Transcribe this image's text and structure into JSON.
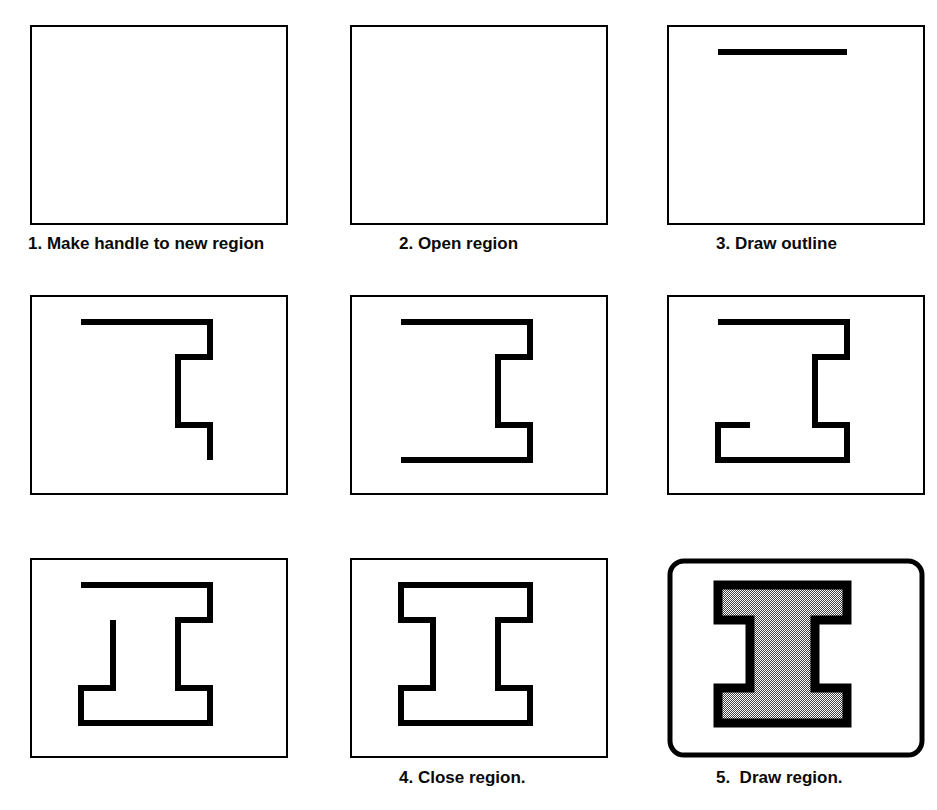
{
  "figure": {
    "background_color": "#ffffff",
    "ink_color": "#000000",
    "fill_pattern_color": "#808080",
    "panel_count": 9,
    "caption_count": 5
  },
  "panels": [
    {
      "id": "panel-1",
      "index": 1,
      "row": 1,
      "col": 1,
      "frame": "rectangle",
      "frame_style": "thin",
      "content": "empty",
      "caption": "1. Make handle to new region"
    },
    {
      "id": "panel-2",
      "index": 2,
      "row": 1,
      "col": 2,
      "frame": "rectangle",
      "frame_style": "thin",
      "content": "empty",
      "caption": "2. Open region"
    },
    {
      "id": "panel-3",
      "index": 3,
      "row": 1,
      "col": 3,
      "frame": "rectangle",
      "frame_style": "thin",
      "content": "single-horizontal-stroke",
      "caption": "3. Draw outline"
    },
    {
      "id": "panel-4",
      "index": 4,
      "row": 2,
      "col": 1,
      "frame": "rectangle",
      "frame_style": "thin",
      "content": "partial-outline-top-right",
      "caption": ""
    },
    {
      "id": "panel-5",
      "index": 5,
      "row": 2,
      "col": 2,
      "frame": "rectangle",
      "frame_style": "thin",
      "content": "partial-outline-with-bottom-bar",
      "caption": ""
    },
    {
      "id": "panel-6",
      "index": 6,
      "row": 2,
      "col": 3,
      "frame": "rectangle",
      "frame_style": "thin",
      "content": "partial-outline-bottom-left-flange",
      "caption": ""
    },
    {
      "id": "panel-7",
      "index": 7,
      "row": 3,
      "col": 1,
      "frame": "rectangle",
      "frame_style": "thin",
      "content": "partial-outline-left-waist",
      "caption": ""
    },
    {
      "id": "panel-8",
      "index": 8,
      "row": 3,
      "col": 2,
      "frame": "rectangle",
      "frame_style": "thin",
      "content": "closed-ibeam-outline",
      "caption": "4. Close region."
    },
    {
      "id": "panel-9",
      "index": 9,
      "row": 3,
      "col": 3,
      "frame": "rounded-rectangle",
      "frame_style": "thick",
      "content": "filled-ibeam-region",
      "caption": "5.  Draw region."
    }
  ],
  "captions": [
    {
      "text": "1. Make handle to new region",
      "x": 28,
      "y": 234
    },
    {
      "text": "2. Open region",
      "x": 399,
      "y": 234
    },
    {
      "text": "3. Draw outline",
      "x": 716,
      "y": 234
    },
    {
      "text": "4. Close region.",
      "x": 399,
      "y": 768
    },
    {
      "text": "5.  Draw region.",
      "x": 716,
      "y": 768
    }
  ]
}
